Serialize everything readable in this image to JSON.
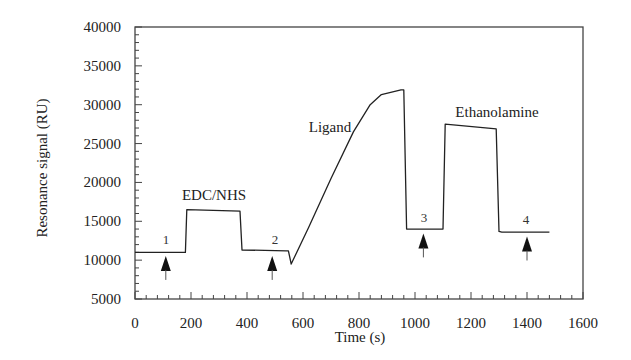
{
  "chart_data": {
    "type": "line",
    "title": "",
    "xlabel": "Time (s)",
    "ylabel": "Resonance signal (RU)",
    "xlim": [
      0,
      1600
    ],
    "ylim": [
      5000,
      40000
    ],
    "x_ticks": [
      0,
      200,
      400,
      600,
      800,
      1000,
      1200,
      1400,
      1600
    ],
    "y_ticks": [
      5000,
      10000,
      15000,
      20000,
      25000,
      30000,
      35000,
      40000
    ],
    "x_minor_step": 40,
    "y_minor_step": 1000,
    "grid": false,
    "legend": null,
    "series": [
      {
        "name": "Sensorgram",
        "points": [
          [
            0,
            11000
          ],
          [
            180,
            11000
          ],
          [
            185,
            16500
          ],
          [
            375,
            16300
          ],
          [
            382,
            11300
          ],
          [
            540,
            11200
          ],
          [
            548,
            11200
          ],
          [
            558,
            9500
          ],
          [
            620,
            14200
          ],
          [
            700,
            20500
          ],
          [
            780,
            26500
          ],
          [
            840,
            30000
          ],
          [
            880,
            31300
          ],
          [
            950,
            31900
          ],
          [
            960,
            31900
          ],
          [
            970,
            14000
          ],
          [
            1100,
            14000
          ],
          [
            1108,
            27500
          ],
          [
            1290,
            26900
          ],
          [
            1300,
            13700
          ],
          [
            1310,
            13600
          ],
          [
            1480,
            13600
          ]
        ]
      }
    ],
    "annotations": [
      {
        "text": "EDC/NHS",
        "x": 280,
        "y": 18500
      },
      {
        "text": "Ligand",
        "x": 690,
        "y": 27500
      },
      {
        "text": "Ethanolamine",
        "x": 1220,
        "y": 29300
      },
      {
        "text": "1",
        "x": 110,
        "y": 12900
      },
      {
        "text": "2",
        "x": 490,
        "y": 12900
      },
      {
        "text": "3",
        "x": 1030,
        "y": 15600
      },
      {
        "text": "4",
        "x": 1400,
        "y": 15200
      }
    ],
    "arrows": [
      {
        "label": "1",
        "x": 110,
        "y_tip": 10800
      },
      {
        "label": "2",
        "x": 490,
        "y_tip": 10800
      },
      {
        "label": "3",
        "x": 1030,
        "y_tip": 13700
      },
      {
        "label": "4",
        "x": 1400,
        "y_tip": 13300
      }
    ]
  },
  "labels": {
    "ylabel": "Resonance signal (RU)",
    "xlabel": "Time (s)",
    "edc": "EDC/NHS",
    "ligand": "Ligand",
    "ethanolamine": "Ethanolamine",
    "s1": "1",
    "s2": "2",
    "s3": "3",
    "s4": "4"
  },
  "colors": {
    "line": "#222222",
    "frame": "#444444",
    "background": "#ffffff"
  }
}
